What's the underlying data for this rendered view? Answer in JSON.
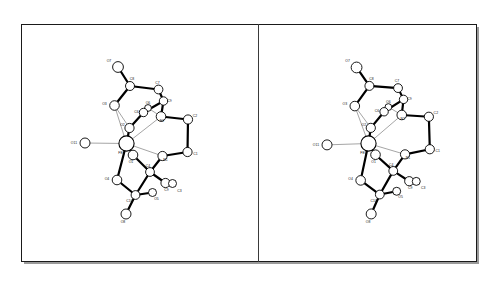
{
  "figure": {
    "background_color": "#ffffff",
    "frame_color": "#1a1a1a",
    "bond_color": "#000000",
    "atom_fill": "#ffffff",
    "label_color": "#111111"
  },
  "panels": [
    {
      "id": "left",
      "name": "stereo-view-left"
    },
    {
      "id": "right",
      "name": "stereo-view-right"
    }
  ],
  "chart_data": {
    "type": "scatter",
    "title": "",
    "xlabel": "",
    "ylabel": "",
    "projection": "stereo-pair ORTEP molecular structure",
    "atom_labels": [
      "O7",
      "C8",
      "O3",
      "C7",
      "C9",
      "O6",
      "C6",
      "O2",
      "N2",
      "C2",
      "O11",
      "FE1",
      "O1",
      "N1",
      "C1",
      "C4",
      "O4",
      "C9b",
      "C3",
      "C10",
      "O5",
      "O8"
    ],
    "atoms": [
      {
        "label": "O7",
        "x": 118.0,
        "y": 67.0,
        "r": 5.4,
        "size": "large"
      },
      {
        "label": "C8",
        "x": 130.0,
        "y": 86.0,
        "r": 4.5,
        "size": "medium"
      },
      {
        "label": "O3",
        "x": 114.5,
        "y": 105.5,
        "r": 4.8,
        "size": "medium"
      },
      {
        "label": "C7",
        "x": 158.5,
        "y": 89.5,
        "r": 4.4,
        "size": "medium"
      },
      {
        "label": "C9",
        "x": 163.5,
        "y": 101.0,
        "r": 4.2,
        "size": "medium"
      },
      {
        "label": "O6",
        "x": 148.0,
        "y": 108.0,
        "r": 3.4,
        "size": "small"
      },
      {
        "label": "C6",
        "x": 143.5,
        "y": 112.5,
        "r": 4.2,
        "size": "medium"
      },
      {
        "label": "O2",
        "x": 129.5,
        "y": 128.0,
        "r": 4.6,
        "size": "medium"
      },
      {
        "label": "N2",
        "x": 161.0,
        "y": 116.5,
        "r": 4.8,
        "size": "medium"
      },
      {
        "label": "C2",
        "x": 188.0,
        "y": 119.5,
        "r": 4.6,
        "size": "medium"
      },
      {
        "label": "O11",
        "x": 85.0,
        "y": 143.0,
        "r": 5.0,
        "size": "medium"
      },
      {
        "label": "FE1",
        "x": 126.5,
        "y": 143.5,
        "r": 7.6,
        "size": "xlarge"
      },
      {
        "label": "O1",
        "x": 133.0,
        "y": 155.0,
        "r": 4.8,
        "size": "medium"
      },
      {
        "label": "N1",
        "x": 162.5,
        "y": 156.0,
        "r": 4.6,
        "size": "medium"
      },
      {
        "label": "C1",
        "x": 187.5,
        "y": 152.0,
        "r": 4.6,
        "size": "medium"
      },
      {
        "label": "C4",
        "x": 150.0,
        "y": 172.0,
        "r": 4.4,
        "size": "medium"
      },
      {
        "label": "O4",
        "x": 117.0,
        "y": 180.0,
        "r": 4.8,
        "size": "medium"
      },
      {
        "label": "C9b",
        "x": 165.5,
        "y": 183.0,
        "r": 4.6,
        "size": "medium"
      },
      {
        "label": "C3",
        "x": 172.5,
        "y": 183.5,
        "r": 4.0,
        "size": "small"
      },
      {
        "label": "C10",
        "x": 135.5,
        "y": 195.0,
        "r": 4.4,
        "size": "medium"
      },
      {
        "label": "O5",
        "x": 152.5,
        "y": 192.5,
        "r": 4.0,
        "size": "small"
      },
      {
        "label": "O8",
        "x": 126.0,
        "y": 214.0,
        "r": 5.0,
        "size": "medium"
      }
    ],
    "bonds": [
      [
        "O7",
        "C8"
      ],
      [
        "C8",
        "O3"
      ],
      [
        "C8",
        "C7"
      ],
      [
        "C7",
        "C9"
      ],
      [
        "C9",
        "N2"
      ],
      [
        "C9",
        "C6"
      ],
      [
        "C6",
        "O6"
      ],
      [
        "C6",
        "O2"
      ],
      [
        "O2",
        "FE1"
      ],
      [
        "N2",
        "C2"
      ],
      [
        "C2",
        "C1"
      ],
      [
        "C1",
        "N1"
      ],
      [
        "N1",
        "C4"
      ],
      [
        "C4",
        "C9b"
      ],
      [
        "C4",
        "C10"
      ],
      [
        "C9b",
        "C3"
      ],
      [
        "C10",
        "O5"
      ],
      [
        "C10",
        "O4"
      ],
      [
        "C10",
        "O8"
      ],
      [
        "O4",
        "FE1"
      ],
      [
        "O1",
        "FE1"
      ],
      [
        "O1",
        "C4"
      ]
    ],
    "thin_bonds": [
      [
        "FE1",
        "O11"
      ],
      [
        "FE1",
        "N2"
      ],
      [
        "FE1",
        "N1"
      ],
      [
        "FE1",
        "O3"
      ],
      [
        "FE1",
        "O1"
      ],
      [
        "FE1",
        "O4"
      ],
      [
        "O3",
        "O2"
      ],
      [
        "N2",
        "O6"
      ]
    ]
  },
  "labels": {
    "O7": "O7",
    "C8": "C8",
    "O3": "O3",
    "C7": "C7",
    "C9": "C9",
    "O6": "O6",
    "C6": "C6",
    "O2": "O2",
    "N2": "N2",
    "C2": "C2",
    "O11": "O11",
    "FE1": "FE1",
    "O1": "O1",
    "N1": "N1",
    "C1": "C1",
    "C4": "C4",
    "O4": "O4",
    "C9b": "C9",
    "C3": "C3",
    "C10": "C10",
    "O5": "O5",
    "O8": "O8"
  }
}
